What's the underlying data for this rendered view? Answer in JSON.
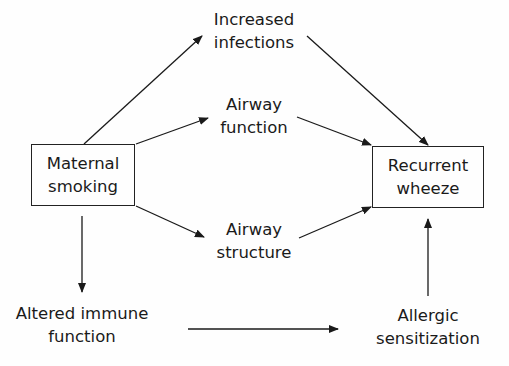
{
  "diagram": {
    "type": "flow",
    "nodes": {
      "maternal_smoking": {
        "lines": [
          "Maternal",
          "smoking"
        ],
        "boxed": true
      },
      "increased_infections": {
        "lines": [
          "Increased",
          "infections"
        ],
        "boxed": false
      },
      "airway_function": {
        "lines": [
          "Airway",
          "function"
        ],
        "boxed": false
      },
      "airway_structure": {
        "lines": [
          "Airway",
          "structure"
        ],
        "boxed": false
      },
      "recurrent_wheeze": {
        "lines": [
          "Recurrent",
          "wheeze"
        ],
        "boxed": true
      },
      "altered_immune_function": {
        "lines": [
          "Altered immune",
          "function"
        ],
        "boxed": false
      },
      "allergic_sensitization": {
        "lines": [
          "Allergic",
          "sensitization"
        ],
        "boxed": false
      }
    },
    "edges": [
      {
        "from": "Maternal smoking",
        "to": "Increased infections"
      },
      {
        "from": "Maternal smoking",
        "to": "Airway function"
      },
      {
        "from": "Maternal smoking",
        "to": "Airway structure"
      },
      {
        "from": "Maternal smoking",
        "to": "Altered immune function"
      },
      {
        "from": "Increased infections",
        "to": "Recurrent wheeze"
      },
      {
        "from": "Airway function",
        "to": "Recurrent wheeze"
      },
      {
        "from": "Airway structure",
        "to": "Recurrent wheeze"
      },
      {
        "from": "Altered immune function",
        "to": "Allergic sensitization"
      },
      {
        "from": "Allergic sensitization",
        "to": "Recurrent wheeze"
      }
    ],
    "colors": {
      "line": "#1a1a1a",
      "background": "#fefefe"
    }
  }
}
